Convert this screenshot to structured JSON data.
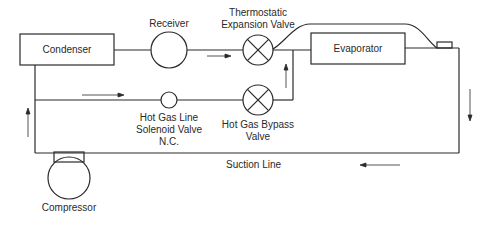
{
  "diagram": {
    "type": "refrigeration-cycle-schematic",
    "stroke_color": "#2a2a2a",
    "background": "#ffffff",
    "components": {
      "condenser": {
        "label": "Condenser"
      },
      "receiver": {
        "label": "Receiver"
      },
      "tev": {
        "label_line1": "Thermostatic",
        "label_line2": "Expansion Valve"
      },
      "evaporator": {
        "label": "Evaporator"
      },
      "solenoid": {
        "label_line1": "Hot Gas Line",
        "label_line2": "Solenoid Valve",
        "label_line3": "N.C."
      },
      "bypass": {
        "label_line1": "Hot Gas Bypass",
        "label_line2": "Valve"
      },
      "compressor": {
        "label": "Compressor"
      },
      "suction_line": {
        "label": "Suction Line"
      }
    },
    "flow_arrows": [
      {
        "location": "liquid line",
        "direction": "right"
      },
      {
        "location": "hot gas line",
        "direction": "right"
      },
      {
        "location": "bypass riser",
        "direction": "up"
      },
      {
        "location": "evaporator outlet",
        "direction": "down"
      },
      {
        "location": "suction line",
        "direction": "left"
      },
      {
        "location": "compressor discharge",
        "direction": "up"
      }
    ]
  }
}
